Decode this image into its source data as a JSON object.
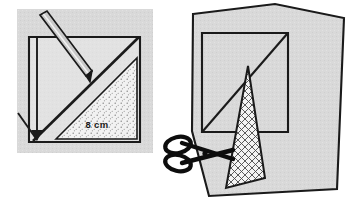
{
  "figure": {
    "background_color": "#ffffff",
    "paper_fill_color": "#d9d9d9",
    "outline_color": "#1a1a1a",
    "panels": [
      {
        "id": "panel-left",
        "name": "marking-step",
        "caption": "Mark the diagonal on the square sheet",
        "shapes": [
          {
            "name": "paper-sheet",
            "kind": "square",
            "fill": "#d9d9d9"
          },
          {
            "name": "square-outline",
            "kind": "square-frame"
          },
          {
            "name": "diagonal-line",
            "kind": "line"
          },
          {
            "name": "shaded-triangle",
            "kind": "triangle",
            "fill": "stippled"
          },
          {
            "name": "pencil",
            "kind": "tool"
          },
          {
            "name": "dimension-arrow",
            "kind": "arrow"
          }
        ],
        "labels": [
          {
            "name": "side-length-label",
            "text": "8 cm"
          }
        ]
      },
      {
        "id": "panel-right",
        "name": "cutting-step",
        "caption": "Cut out the triangle with scissors",
        "shapes": [
          {
            "name": "paper-sheet",
            "kind": "quadrilateral",
            "fill": "#d9d9d9"
          },
          {
            "name": "square-outline",
            "kind": "square-frame"
          },
          {
            "name": "diagonal-line",
            "kind": "line"
          },
          {
            "name": "cut-triangle",
            "kind": "triangle",
            "fill": "cross-hatched"
          },
          {
            "name": "scissors",
            "kind": "tool"
          }
        ],
        "labels": []
      }
    ]
  },
  "colors": {
    "paper": "#d9d9d9",
    "paper_light": "#e6e6e6",
    "ink": "#1a1a1a",
    "pencil_body": "#b8b8b8",
    "white": "#ffffff"
  },
  "measurements": {
    "side_label": "8 cm"
  }
}
